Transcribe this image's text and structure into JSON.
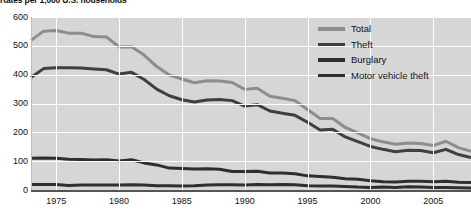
{
  "chart_data": {
    "type": "line",
    "title": "Rates per 1,000 U.S. households",
    "xlabel": "",
    "ylabel": "",
    "xlim": [
      1973,
      2008
    ],
    "ylim": [
      0,
      600
    ],
    "grid": true,
    "legend_position": "top-right",
    "x_ticks": [
      "1975",
      "1980",
      "1985",
      "1990",
      "1995",
      "2000",
      "2005"
    ],
    "x_tick_values": [
      1975,
      1980,
      1985,
      1990,
      1995,
      2000,
      2005
    ],
    "y_ticks": [
      "0",
      "100",
      "200",
      "300",
      "400",
      "500",
      "600"
    ],
    "y_tick_values": [
      0,
      100,
      200,
      300,
      400,
      500,
      600
    ],
    "x": [
      1973,
      1974,
      1975,
      1976,
      1977,
      1978,
      1979,
      1980,
      1981,
      1982,
      1983,
      1984,
      1985,
      1986,
      1987,
      1988,
      1989,
      1990,
      1991,
      1992,
      1993,
      1994,
      1995,
      1996,
      1997,
      1998,
      1999,
      2000,
      2001,
      2002,
      2003,
      2004,
      2005,
      2006,
      2007,
      2008
    ],
    "series": [
      {
        "name": "Total",
        "color": "#8d8d8d",
        "values": [
          519,
          551,
          553,
          544,
          544,
          532,
          531,
          496,
          497,
          468,
          428,
          399,
          385,
          372,
          379,
          378,
          373,
          349,
          353,
          325,
          318,
          310,
          279,
          248,
          248,
          217,
          198,
          178,
          167,
          159,
          163,
          161,
          154,
          169,
          147,
          134
        ]
      },
      {
        "name": "Theft",
        "color": "#3f3f3f",
        "values": [
          390,
          421,
          424,
          424,
          423,
          420,
          417,
          402,
          408,
          383,
          350,
          327,
          313,
          305,
          312,
          314,
          310,
          291,
          296,
          274,
          266,
          259,
          235,
          208,
          211,
          184,
          168,
          151,
          141,
          133,
          138,
          137,
          129,
          141,
          123,
          113
        ]
      },
      {
        "name": "Burglary",
        "color": "#2e2e2e",
        "values": [
          110,
          111,
          110,
          107,
          106,
          104,
          105,
          101,
          105,
          94,
          87,
          76,
          75,
          73,
          74,
          72,
          64,
          64,
          65,
          59,
          59,
          56,
          49,
          47,
          44,
          39,
          37,
          32,
          29,
          28,
          30,
          30,
          29,
          30,
          27,
          26
        ]
      },
      {
        "name": "Motor vehicle theft",
        "color": "#2e2e2e",
        "values": [
          19,
          19,
          19,
          16,
          17,
          17,
          17,
          17,
          18,
          17,
          15,
          15,
          14,
          15,
          17,
          18,
          18,
          17,
          19,
          18,
          19,
          18,
          15,
          14,
          14,
          12,
          10,
          9,
          10,
          9,
          11,
          10,
          9,
          9,
          8,
          7
        ]
      }
    ]
  },
  "legend": {
    "items": [
      {
        "label": "Total",
        "color": "#8d8d8d"
      },
      {
        "label": "Theft",
        "color": "#3f3f3f"
      },
      {
        "label": "Burglary",
        "color": "#2e2e2e"
      },
      {
        "label": "Motor vehicle theft",
        "color": "#2e2e2e"
      }
    ]
  },
  "colors": {
    "plot_background": "#d6d6d6",
    "gridline": "#ffffff",
    "axis": "#555555",
    "text": "#111111"
  }
}
